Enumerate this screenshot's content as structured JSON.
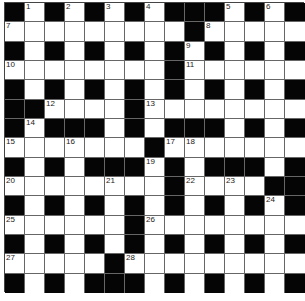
{
  "puzzle": {
    "rows": 15,
    "cols": 15,
    "layout": [
      "010101010001010",
      "111111111011111",
      "010101010101010",
      "111111110111111",
      "010101010101010",
      "001111011111111",
      "010001010001010",
      "111111101111111",
      "010100010100010",
      "111111110111100",
      "010101010101010",
      "111111011111111",
      "010101010101010",
      "111110111111111",
      "010100010101010"
    ],
    "numbers": [
      {
        "r": 0,
        "c": 1,
        "n": "1"
      },
      {
        "r": 0,
        "c": 3,
        "n": "2"
      },
      {
        "r": 0,
        "c": 5,
        "n": "3"
      },
      {
        "r": 0,
        "c": 7,
        "n": "4"
      },
      {
        "r": 0,
        "c": 11,
        "n": "5"
      },
      {
        "r": 0,
        "c": 13,
        "n": "6"
      },
      {
        "r": 1,
        "c": 0,
        "n": "7"
      },
      {
        "r": 1,
        "c": 10,
        "n": "8"
      },
      {
        "r": 2,
        "c": 9,
        "n": "9"
      },
      {
        "r": 3,
        "c": 0,
        "n": "10"
      },
      {
        "r": 3,
        "c": 9,
        "n": "11"
      },
      {
        "r": 5,
        "c": 2,
        "n": "12"
      },
      {
        "r": 5,
        "c": 7,
        "n": "13"
      },
      {
        "r": 6,
        "c": 1,
        "n": "14"
      },
      {
        "r": 7,
        "c": 0,
        "n": "15"
      },
      {
        "r": 7,
        "c": 3,
        "n": "16"
      },
      {
        "r": 7,
        "c": 8,
        "n": "17"
      },
      {
        "r": 7,
        "c": 9,
        "n": "18"
      },
      {
        "r": 8,
        "c": 7,
        "n": "19"
      },
      {
        "r": 9,
        "c": 0,
        "n": "20"
      },
      {
        "r": 9,
        "c": 5,
        "n": "21"
      },
      {
        "r": 9,
        "c": 9,
        "n": "22"
      },
      {
        "r": 9,
        "c": 11,
        "n": "23"
      },
      {
        "r": 10,
        "c": 13,
        "n": "24"
      },
      {
        "r": 11,
        "c": 0,
        "n": "25"
      },
      {
        "r": 11,
        "c": 7,
        "n": "26"
      },
      {
        "r": 13,
        "c": 0,
        "n": "27"
      },
      {
        "r": 13,
        "c": 6,
        "n": "28"
      }
    ],
    "colors": {
      "black": "#050505",
      "white": "#ffffff",
      "gridline": "#666666"
    }
  },
  "footer": {
    "text": ""
  }
}
